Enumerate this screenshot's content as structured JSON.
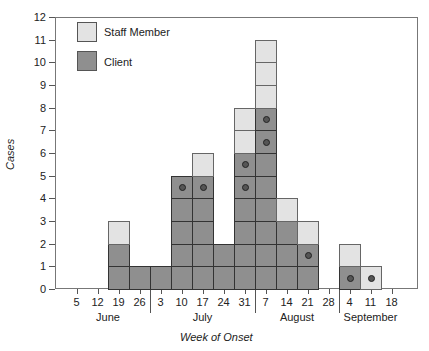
{
  "chart_data": {
    "type": "bar",
    "title": "",
    "xlabel": "Week of Onset",
    "ylabel": "Cases",
    "ylim": [
      0,
      12
    ],
    "yticks": [
      0,
      1,
      2,
      3,
      4,
      5,
      6,
      7,
      8,
      9,
      10,
      11,
      12
    ],
    "grid": false,
    "legend_position": "upper-left",
    "categories": [
      "5",
      "12",
      "19",
      "26",
      "3",
      "10",
      "17",
      "24",
      "31",
      "7",
      "14",
      "21",
      "28",
      "4",
      "11",
      "18"
    ],
    "months": [
      {
        "label": "June",
        "weeks": [
          "5",
          "12",
          "19",
          "26"
        ]
      },
      {
        "label": "July",
        "weeks": [
          "3",
          "10",
          "17",
          "24",
          "31"
        ]
      },
      {
        "label": "August",
        "weeks": [
          "7",
          "14",
          "21",
          "28"
        ]
      },
      {
        "label": "September",
        "weeks": [
          "4",
          "11",
          "18"
        ]
      }
    ],
    "series": [
      {
        "name": "Client",
        "color": "#8f8f8f",
        "values": [
          0,
          0,
          2,
          1,
          1,
          5,
          5,
          2,
          6,
          8,
          3,
          2,
          0,
          1,
          0,
          0
        ]
      },
      {
        "name": "Staff Member",
        "color": "#e3e3e3",
        "values": [
          0,
          0,
          1,
          0,
          0,
          0,
          1,
          0,
          2,
          3,
          1,
          1,
          0,
          1,
          1,
          0
        ]
      }
    ],
    "marked_cases": [
      {
        "week": "10",
        "month": "July",
        "level": 5
      },
      {
        "week": "17",
        "month": "July",
        "level": 5
      },
      {
        "week": "31",
        "month": "July",
        "level": 5
      },
      {
        "week": "31",
        "month": "July",
        "level": 6
      },
      {
        "week": "7",
        "month": "August",
        "level": 7
      },
      {
        "week": "7",
        "month": "August",
        "level": 8
      },
      {
        "week": "21",
        "month": "August",
        "level": 2
      },
      {
        "week": "4",
        "month": "September",
        "level": 1
      },
      {
        "week": "11",
        "month": "September",
        "level": 1
      }
    ]
  },
  "legend": {
    "staff": "Staff Member",
    "client": "Client"
  },
  "axes": {
    "x_title": "Week of Onset",
    "y_title": "Cases"
  }
}
